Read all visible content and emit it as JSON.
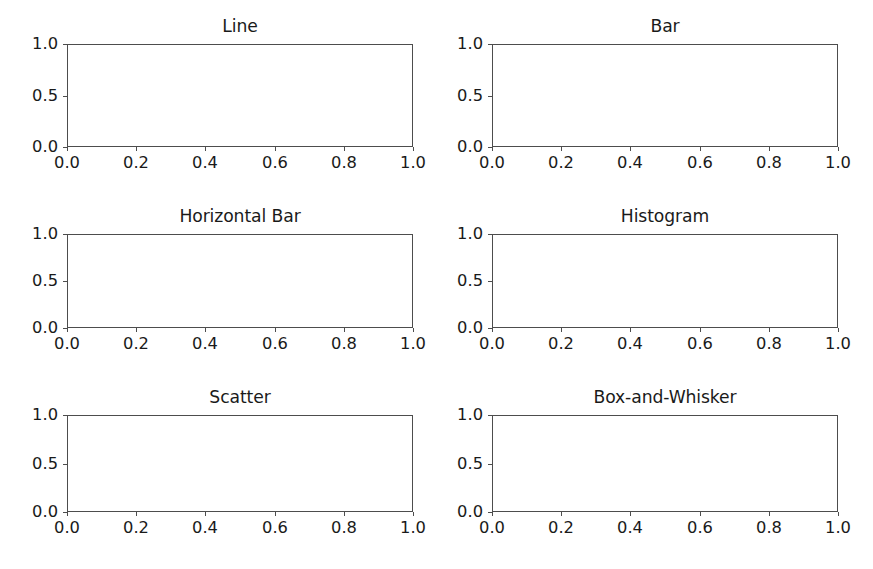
{
  "figure": {
    "background_color": "#ffffff",
    "width": 873,
    "height": 569,
    "rows": 3,
    "cols": 2
  },
  "chart_data": {
    "type": "table",
    "title": "",
    "layout": "3x2 grid of empty matplotlib axes",
    "grid": false,
    "legend": null,
    "shared_axes": {
      "xlim": [
        0.0,
        1.0
      ],
      "ylim": [
        0.0,
        1.0
      ],
      "xticks": [
        0.0,
        0.2,
        0.4,
        0.6,
        0.8,
        1.0
      ],
      "yticks": [
        0.0,
        0.5,
        1.0
      ],
      "xticklabels": [
        "0.0",
        "0.2",
        "0.4",
        "0.6",
        "0.8",
        "1.0"
      ],
      "yticklabels": [
        "0.0",
        "0.5",
        "1.0"
      ],
      "xlabel": "",
      "ylabel": ""
    },
    "subplots": [
      {
        "index": 0,
        "row": 0,
        "col": 0,
        "title": "Line",
        "type": "line",
        "series": [],
        "values": [],
        "categories": [],
        "xlim": [
          0.0,
          1.0
        ],
        "ylim": [
          0.0,
          1.0
        ],
        "xlabel": "",
        "ylabel": "",
        "xticklabels": [
          "0.0",
          "0.2",
          "0.4",
          "0.6",
          "0.8",
          "1.0"
        ],
        "yticklabels": [
          "0.0",
          "0.5",
          "1.0"
        ]
      },
      {
        "index": 1,
        "row": 0,
        "col": 1,
        "title": "Bar",
        "type": "bar",
        "series": [],
        "values": [],
        "categories": [],
        "xlim": [
          0.0,
          1.0
        ],
        "ylim": [
          0.0,
          1.0
        ],
        "xlabel": "",
        "ylabel": "",
        "xticklabels": [
          "0.0",
          "0.2",
          "0.4",
          "0.6",
          "0.8",
          "1.0"
        ],
        "yticklabels": [
          "0.0",
          "0.5",
          "1.0"
        ]
      },
      {
        "index": 2,
        "row": 1,
        "col": 0,
        "title": "Horizontal Bar",
        "type": "barh",
        "series": [],
        "values": [],
        "categories": [],
        "xlim": [
          0.0,
          1.0
        ],
        "ylim": [
          0.0,
          1.0
        ],
        "xlabel": "",
        "ylabel": "",
        "xticklabels": [
          "0.0",
          "0.2",
          "0.4",
          "0.6",
          "0.8",
          "1.0"
        ],
        "yticklabels": [
          "0.0",
          "0.5",
          "1.0"
        ]
      },
      {
        "index": 3,
        "row": 1,
        "col": 1,
        "title": "Histogram",
        "type": "histogram",
        "series": [],
        "values": [],
        "categories": [],
        "xlim": [
          0.0,
          1.0
        ],
        "ylim": [
          0.0,
          1.0
        ],
        "xlabel": "",
        "ylabel": "",
        "xticklabels": [
          "0.0",
          "0.2",
          "0.4",
          "0.6",
          "0.8",
          "1.0"
        ],
        "yticklabels": [
          "0.0",
          "0.5",
          "1.0"
        ]
      },
      {
        "index": 4,
        "row": 2,
        "col": 0,
        "title": "Scatter",
        "type": "scatter",
        "series": [],
        "values": [],
        "categories": [],
        "xlim": [
          0.0,
          1.0
        ],
        "ylim": [
          0.0,
          1.0
        ],
        "xlabel": "",
        "ylabel": "",
        "xticklabels": [
          "0.0",
          "0.2",
          "0.4",
          "0.6",
          "0.8",
          "1.0"
        ],
        "yticklabels": [
          "0.0",
          "0.5",
          "1.0"
        ]
      },
      {
        "index": 5,
        "row": 2,
        "col": 1,
        "title": "Box-and-Whisker",
        "type": "box",
        "series": [],
        "values": [],
        "categories": [],
        "xlim": [
          0.0,
          1.0
        ],
        "ylim": [
          0.0,
          1.0
        ],
        "xlabel": "",
        "ylabel": "",
        "xticklabels": [
          "0.0",
          "0.2",
          "0.4",
          "0.6",
          "0.8",
          "1.0"
        ],
        "yticklabels": [
          "0.0",
          "0.5",
          "1.0"
        ]
      }
    ]
  },
  "style": {
    "spine_color": "#4d4d4d",
    "text_color": "#1a1a1a",
    "tick_color": "#4d4d4d",
    "axes_facecolor": "#ffffff"
  },
  "geometry": {
    "col_left": {
      "x": 67,
      "width": 346
    },
    "col_right": {
      "x": 492,
      "width": 346
    },
    "row_0": {
      "y": 44,
      "height": 103
    },
    "row_1": {
      "y": 234,
      "height": 94
    },
    "row_2": {
      "y": 415,
      "height": 97
    }
  }
}
